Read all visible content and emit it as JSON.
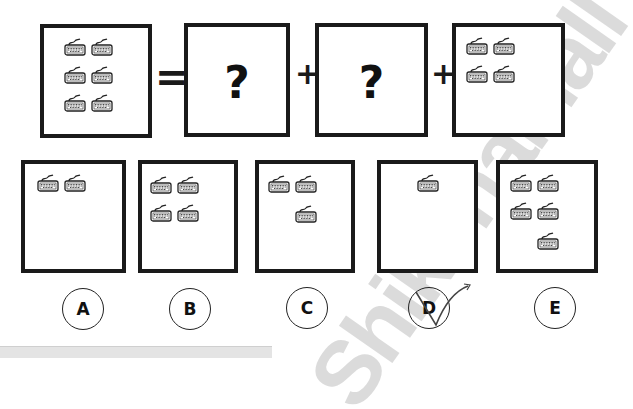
{
  "puzzle": {
    "icon": "keyboard-icon",
    "equation": {
      "operators": [
        "=",
        "+",
        "+"
      ],
      "boxes": [
        {
          "role": "total",
          "keyboard_count": 6
        },
        {
          "role": "unknown",
          "label": "?"
        },
        {
          "role": "unknown",
          "label": "?"
        },
        {
          "role": "known",
          "keyboard_count": 4
        }
      ]
    },
    "options": [
      {
        "letter": "A",
        "keyboard_count": 2
      },
      {
        "letter": "B",
        "keyboard_count": 4
      },
      {
        "letter": "C",
        "keyboard_count": 3
      },
      {
        "letter": "D",
        "keyboard_count": 1,
        "marked": true
      },
      {
        "letter": "E",
        "keyboard_count": 5
      }
    ],
    "answer_mark": "checkmark"
  },
  "watermark": "ShikshaMall"
}
